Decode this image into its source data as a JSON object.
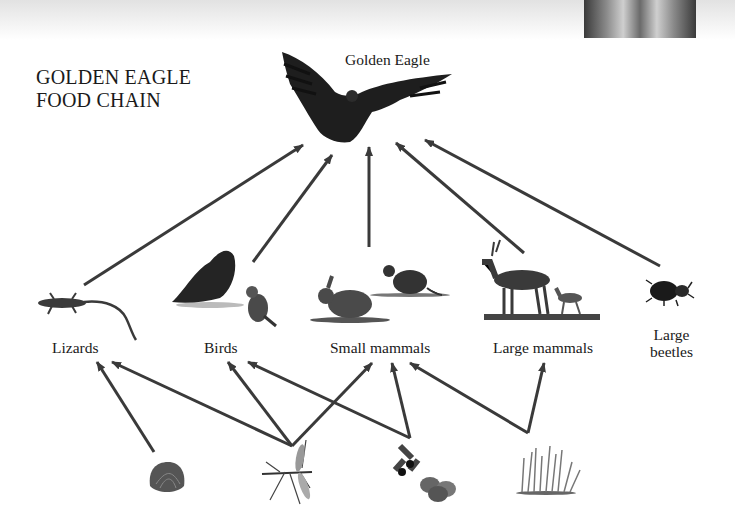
{
  "title": {
    "line1": "GOLDEN EAGLE",
    "line2": "FOOD CHAIN"
  },
  "apex": {
    "label": "Golden Eagle",
    "icon": "eagle-icon"
  },
  "prey": [
    {
      "id": "lizards",
      "label": "Lizards",
      "icon": "lizard-icon"
    },
    {
      "id": "birds",
      "label": "Birds",
      "icon": "birds-icon"
    },
    {
      "id": "small_mammals",
      "label": "Small mammals",
      "icon": "rabbit-rat-icon"
    },
    {
      "id": "large_mammals",
      "label": "Large mammals",
      "icon": "deer-icon"
    },
    {
      "id": "large_beetles",
      "label_line1": "Large",
      "label_line2": "beetles",
      "icon": "beetle-icon"
    }
  ],
  "producers": [
    {
      "id": "shellfish",
      "icon": "shell-icon"
    },
    {
      "id": "insects",
      "icon": "crane-fly-icon"
    },
    {
      "id": "berries_seeds",
      "icon": "berries-icon"
    },
    {
      "id": "grass",
      "icon": "grass-icon"
    }
  ],
  "links": [
    {
      "from": "lizards",
      "to": "golden_eagle"
    },
    {
      "from": "birds",
      "to": "golden_eagle"
    },
    {
      "from": "small_mammals",
      "to": "golden_eagle"
    },
    {
      "from": "large_mammals",
      "to": "golden_eagle"
    },
    {
      "from": "large_beetles",
      "to": "golden_eagle"
    },
    {
      "from": "shellfish",
      "to": "lizards"
    },
    {
      "from": "insects",
      "to": "lizards"
    },
    {
      "from": "insects",
      "to": "birds"
    },
    {
      "from": "insects",
      "to": "small_mammals"
    },
    {
      "from": "berries_seeds",
      "to": "birds"
    },
    {
      "from": "berries_seeds",
      "to": "small_mammals"
    },
    {
      "from": "grass",
      "to": "small_mammals"
    },
    {
      "from": "grass",
      "to": "large_mammals"
    }
  ],
  "colors": {
    "arrow": "#3a3a3a",
    "text": "#1a1a1a"
  }
}
